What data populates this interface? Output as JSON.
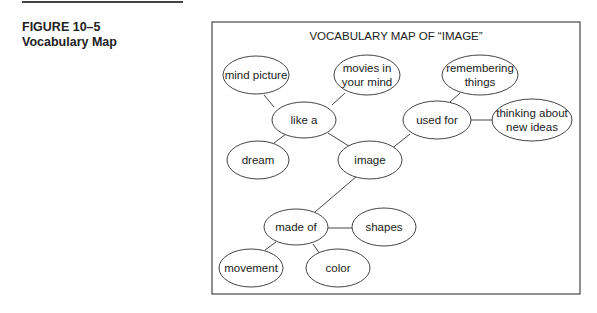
{
  "figure": {
    "number": "FIGURE 10–5",
    "caption": "Vocabulary Map"
  },
  "diagram": {
    "title": "VOCABULARY MAP OF “IMAGE”",
    "nodes": [
      {
        "id": "mind_picture",
        "lines": [
          "mind picture"
        ]
      },
      {
        "id": "movies",
        "lines": [
          "movies in",
          "your mind"
        ]
      },
      {
        "id": "like_a",
        "lines": [
          "like a"
        ]
      },
      {
        "id": "dream",
        "lines": [
          "dream"
        ]
      },
      {
        "id": "image",
        "lines": [
          "image"
        ]
      },
      {
        "id": "used_for",
        "lines": [
          "used for"
        ]
      },
      {
        "id": "remembering",
        "lines": [
          "remembering",
          "things"
        ]
      },
      {
        "id": "thinking",
        "lines": [
          "thinking about",
          "new ideas"
        ]
      },
      {
        "id": "made_of",
        "lines": [
          "made of"
        ]
      },
      {
        "id": "shapes",
        "lines": [
          "shapes"
        ]
      },
      {
        "id": "movement",
        "lines": [
          "movement"
        ]
      },
      {
        "id": "color",
        "lines": [
          "color"
        ]
      }
    ],
    "edges": [
      [
        "like_a",
        "mind_picture"
      ],
      [
        "like_a",
        "movies"
      ],
      [
        "like_a",
        "dream"
      ],
      [
        "like_a",
        "image"
      ],
      [
        "image",
        "used_for"
      ],
      [
        "used_for",
        "remembering"
      ],
      [
        "used_for",
        "thinking"
      ],
      [
        "image",
        "made_of"
      ],
      [
        "made_of",
        "shapes"
      ],
      [
        "made_of",
        "movement"
      ],
      [
        "made_of",
        "color"
      ]
    ]
  }
}
